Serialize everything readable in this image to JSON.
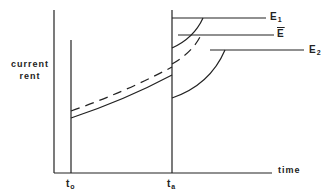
{
  "diagram": {
    "y_axis_label_line1": "current",
    "y_axis_label_line2": "rent",
    "x_axis_label": "time",
    "ticks": {
      "t0": {
        "base": "t",
        "sub": "o"
      },
      "ta": {
        "base": "t",
        "sub": "a"
      }
    },
    "levels": {
      "E1": {
        "base": "E",
        "sub": "1"
      },
      "Ebar": {
        "base": "E"
      },
      "E2": {
        "base": "E",
        "sub": "2"
      }
    },
    "colors": {
      "ink": "#222222",
      "background": "#ffffff"
    }
  }
}
